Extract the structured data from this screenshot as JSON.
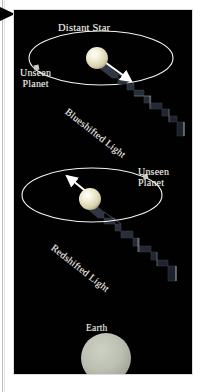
{
  "figure": {
    "background_color": "#010101",
    "panel_border_color": "#dcdcdc",
    "page_background": "#ffffff",
    "label_color": "#f2f0ea",
    "star_color": "#ece6c8",
    "earth_color": "#b3b7ab",
    "orbit_color": "#f4f4f0",
    "wave_color": "#2a2f3a",
    "arrow_color": "#ffffff",
    "corner_marker_color": "#000000",
    "corner_marker_icon": "triangle-right-icon"
  },
  "labels": {
    "distant_star": "Distant Star",
    "unseen_planet_top": "Unseen\nPlanet",
    "unseen_planet_bottom": "Unseen\nPlanet",
    "blueshifted_light": "Blueshifted Light",
    "redshifted_light": "Redshifted Light",
    "earth": "Earth"
  },
  "systems": [
    {
      "name": "top-system",
      "shift": "blueshifted",
      "star": {
        "cx": 83,
        "cy": 48,
        "r": 11
      },
      "orbit": {
        "cx": 87,
        "cy": 48,
        "rx": 72,
        "ry": 27
      },
      "planet_marker": {
        "x": 22,
        "y": 58,
        "size": 5,
        "shape": "square"
      },
      "velocity_arrow": {
        "from": [
          88,
          50
        ],
        "to": [
          118,
          72
        ],
        "direction": "toward-earth"
      },
      "wave_label": "Blueshifted Light"
    },
    {
      "name": "bottom-system",
      "shift": "redshifted",
      "star": {
        "cx": 76,
        "cy": 189,
        "r": 11
      },
      "orbit": {
        "cx": 78,
        "cy": 185,
        "rx": 70,
        "ry": 27
      },
      "planet_marker": {
        "x": 131,
        "y": 167,
        "size": 5,
        "shape": "square"
      },
      "velocity_arrow": {
        "from": [
          80,
          188
        ],
        "to": [
          52,
          165
        ],
        "direction": "away-from-earth"
      },
      "wave_label": "Redshifted Light"
    }
  ],
  "earth_body": {
    "cx": 92,
    "cy": 348,
    "r": 25
  },
  "caption_elements": {
    "icon_names": [
      "triangle-right-icon",
      "star-sphere-icon",
      "planet-marker-icon",
      "orbit-ellipse-icon",
      "velocity-arrow-icon",
      "light-wave-icon",
      "earth-sphere-icon"
    ]
  }
}
